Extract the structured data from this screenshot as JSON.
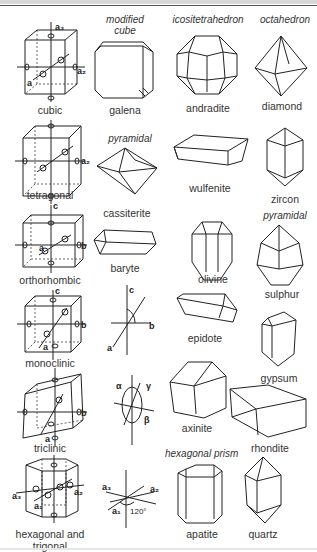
{
  "figure": {
    "headings": {
      "modified_cube": "modified cube",
      "icositetrahedron": "icositetrahedron",
      "octahedron": "octahedron",
      "pyramidal_1": "pyramidal",
      "pyramidal_2": "pyramidal",
      "hexagonal_prism": "hexagonal prism"
    },
    "systems": [
      {
        "name": "cubic",
        "axes": [
          "a1",
          "a2",
          "a3"
        ]
      },
      {
        "name": "tetragonal",
        "axes": [
          "a1",
          "a2",
          "c"
        ]
      },
      {
        "name": "orthorhombic",
        "axes": [
          "a",
          "b",
          "c"
        ]
      },
      {
        "name": "monoclinic",
        "axes": [
          "a",
          "b",
          "c"
        ]
      },
      {
        "name": "triclinic",
        "axes": [
          "a",
          "b",
          "c"
        ],
        "angles": [
          "α",
          "β",
          "γ"
        ]
      },
      {
        "name": "hexagonal and trigonal",
        "name_line1": "hexagonal and",
        "name_line2": "trigonal",
        "axes": [
          "a1",
          "a2",
          "a3",
          "c"
        ],
        "angle": "120°"
      }
    ],
    "minerals": [
      {
        "name": "galena",
        "system": "cubic"
      },
      {
        "name": "andradite",
        "system": "cubic"
      },
      {
        "name": "diamond",
        "system": "cubic"
      },
      {
        "name": "cassiterite",
        "system": "tetragonal"
      },
      {
        "name": "wulfenite",
        "system": "tetragonal"
      },
      {
        "name": "zircon",
        "system": "tetragonal"
      },
      {
        "name": "baryte",
        "system": "orthorhombic"
      },
      {
        "name": "olivine",
        "system": "orthorhombic"
      },
      {
        "name": "sulphur",
        "system": "orthorhombic"
      },
      {
        "name": "epidote",
        "system": "monoclinic"
      },
      {
        "name": "gypsum",
        "system": "monoclinic"
      },
      {
        "name": "axinite",
        "system": "triclinic"
      },
      {
        "name": "rhondite",
        "system": "triclinic"
      },
      {
        "name": "apatite",
        "system": "hexagonal"
      },
      {
        "name": "quartz",
        "system": "trigonal"
      }
    ],
    "axis_labels": {
      "a": "a",
      "b": "b",
      "c": "c",
      "a1": "a₁",
      "a2": "a₂",
      "a3": "a₃",
      "alpha": "α",
      "beta": "β",
      "gamma": "γ",
      "angle120": "120°"
    }
  }
}
